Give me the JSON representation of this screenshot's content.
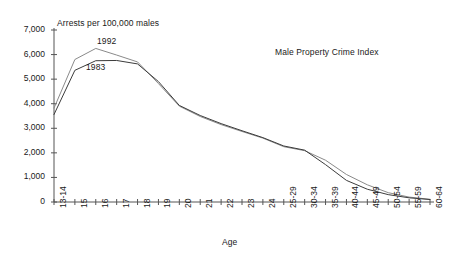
{
  "chart_data": {
    "type": "line",
    "title": "Male Property Crime Index",
    "subtitle": "Arrests per 100,000 males",
    "xlabel": "Age",
    "ylabel": "Arrests per 100,000 males",
    "ylim": [
      0,
      7000
    ],
    "ytick_labels": [
      "7,000",
      "6,000",
      "5,000",
      "4,000",
      "3,000",
      "2,000",
      "1,000",
      "0"
    ],
    "ytick_values": [
      7000,
      6000,
      5000,
      4000,
      3000,
      2000,
      1000,
      0
    ],
    "grid": false,
    "legend_position": "inline-annotations",
    "categories": [
      "13-14",
      "15",
      "16",
      "17",
      "18",
      "19",
      "20",
      "21",
      "22",
      "23",
      "24",
      "25-29",
      "30-34",
      "35-39",
      "40-44",
      "45-49",
      "50-54",
      "55-59",
      "60-64"
    ],
    "series": [
      {
        "name": "1992",
        "color": "#8a8a8a",
        "values": [
          3820,
          5800,
          6250,
          5980,
          5700,
          4820,
          3900,
          3480,
          3150,
          2870,
          2600,
          2250,
          2090,
          1700,
          1120,
          700,
          380,
          200,
          110
        ]
      },
      {
        "name": "1983",
        "color": "#3c3c3c",
        "values": [
          3560,
          5360,
          5750,
          5760,
          5620,
          4900,
          3930,
          3520,
          3190,
          2900,
          2620,
          2280,
          2110,
          1520,
          880,
          520,
          300,
          170,
          100
        ]
      }
    ],
    "annotations": [
      {
        "text": "1992",
        "series": "1992"
      },
      {
        "text": "1983",
        "series": "1983"
      },
      {
        "text": "Male Property Crime Index",
        "role": "title"
      },
      {
        "text": "Arrests per 100,000 males",
        "role": "y-axis-caption"
      }
    ]
  },
  "axis": {
    "x_title": "Age",
    "y_caption": "Arrests per 100,000 males"
  },
  "colors": {
    "series_1992": "#8a8a8a",
    "series_1983": "#3c3c3c",
    "axis": "#555555",
    "text": "#1a1a1a",
    "background": "#ffffff"
  }
}
